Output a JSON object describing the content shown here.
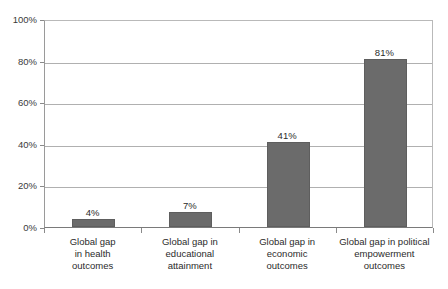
{
  "chart_data": {
    "type": "bar",
    "title": "",
    "subtitle": "",
    "xlabel": "",
    "ylabel": "",
    "ylim": [
      0,
      100
    ],
    "grid": true,
    "legend": false,
    "legend_position": "none",
    "orientation": "vertical",
    "bar_color": "#6b6b6b",
    "gridline_color": "#b0b0b0",
    "axis_color": "#7a7a7a",
    "y_ticks": [
      "0%",
      "20%",
      "40%",
      "60%",
      "80%",
      "100%"
    ],
    "y_tick_values": [
      0,
      20,
      40,
      60,
      80,
      100
    ],
    "categories": [
      "Global gap in health outcomes",
      "Global gap in educational attainment",
      "Global gap in economic outcomes",
      "Global gap in political empowerment outcomes"
    ],
    "category_lines": [
      [
        "Global gap",
        "in health",
        "outcomes"
      ],
      [
        "Global gap in",
        "educational",
        "attainment"
      ],
      [
        "Global gap in",
        "economic",
        "outcomes"
      ],
      [
        "Global gap in political",
        "empowerment",
        "outcomes"
      ]
    ],
    "values": [
      4,
      7,
      41,
      81
    ],
    "data_labels": [
      "4%",
      "7%",
      "41%",
      "81%"
    ]
  }
}
